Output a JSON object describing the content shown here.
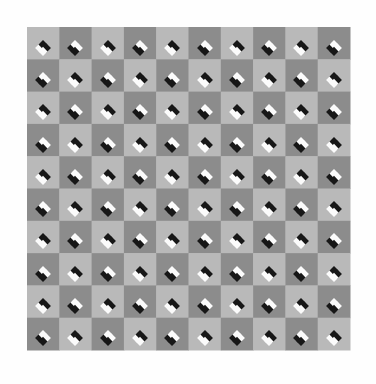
{
  "figure": {
    "caption": "A grid of alternating light and dark gray squares with small black-and-white diamond clusters placed at the square corners, producing an apparent bulging / warping of the straight rows and columns.",
    "type": "optical-illusion-image",
    "illusion_name": "Bulging Checkerboard (Pinna illusion)"
  },
  "canvas": {
    "width": 376,
    "height": 384,
    "background_color": "#fefefe"
  },
  "board": {
    "origin_x": 27,
    "origin_y": 27,
    "cell_size": 32.3,
    "columns": 10,
    "rows": 10,
    "width": 323,
    "height": 323,
    "light_square_color": "#b9b9b9",
    "dark_square_color": "#8c8c8c",
    "edge_blur_px": 0.6
  },
  "dot_clusters": {
    "description": "Four small squares rotated 45 degrees (diamonds) arranged in a 2x2 diamond group centered on each interior vertex of the checkerboard.",
    "diamond_size": 6.4,
    "offset": 3.4,
    "black_color": "#171717",
    "white_color": "#fbfbfb",
    "rows": 10,
    "columns": 10,
    "orientation_legend": {
      "0": "white-left / black-right",
      "1": "black-left / white-right",
      "2": "white-top / black-bottom",
      "3": "black-top / white-bottom"
    },
    "orientation_grid": [
      [
        0,
        1,
        0,
        1,
        0,
        1,
        0,
        1,
        0,
        1
      ],
      [
        1,
        0,
        1,
        0,
        1,
        0,
        1,
        0,
        1,
        0
      ],
      [
        0,
        1,
        0,
        1,
        0,
        1,
        0,
        1,
        0,
        1
      ],
      [
        1,
        0,
        1,
        0,
        1,
        0,
        1,
        0,
        1,
        0
      ],
      [
        0,
        1,
        0,
        1,
        0,
        1,
        0,
        1,
        0,
        1
      ],
      [
        1,
        0,
        1,
        0,
        1,
        0,
        1,
        0,
        1,
        0
      ],
      [
        0,
        1,
        0,
        1,
        0,
        1,
        0,
        1,
        0,
        1
      ],
      [
        1,
        0,
        1,
        0,
        1,
        0,
        1,
        0,
        1,
        0
      ],
      [
        0,
        1,
        0,
        1,
        0,
        1,
        0,
        1,
        0,
        1
      ],
      [
        1,
        0,
        1,
        0,
        1,
        0,
        1,
        0,
        1,
        0
      ]
    ],
    "cluster_x_positions": [
      43,
      75,
      108,
      140,
      172,
      205,
      237,
      269,
      301,
      334
    ],
    "cluster_y_positions": [
      48,
      80,
      112,
      145,
      177,
      209,
      241,
      274,
      306,
      338
    ]
  }
}
